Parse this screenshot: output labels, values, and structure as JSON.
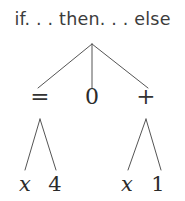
{
  "figure": {
    "kind": "syntax-tree",
    "background_color": "#ffffff",
    "line_color": "#555555",
    "text_color": "#2e2e2e",
    "header_color": "#3c3c3c",
    "header": {
      "label": "if. . . then. . . else"
    },
    "tree": {
      "root": {
        "label": "if. . . then. . . else",
        "arity": 3
      },
      "level_2": [
        {
          "label": "=",
          "role": "condition",
          "x": 40,
          "y": 97
        },
        {
          "label": "0",
          "role": "then-branch",
          "x": 92,
          "y": 97
        },
        {
          "label": "+",
          "role": "else-branch",
          "x": 146,
          "y": 97
        }
      ],
      "leaves": [
        {
          "label": "x",
          "parent": "=",
          "italic": true,
          "x": 25,
          "y": 185
        },
        {
          "label": "4",
          "parent": "=",
          "italic": false,
          "x": 55,
          "y": 185
        },
        {
          "label": "x",
          "parent": "+",
          "italic": true,
          "x": 127,
          "y": 185
        },
        {
          "label": "1",
          "parent": "+",
          "italic": false,
          "x": 158,
          "y": 185
        }
      ]
    },
    "edges": [
      {
        "from": "root",
        "to": "=",
        "x1": 92,
        "y1": 44,
        "x2": 38,
        "y2": 88
      },
      {
        "from": "root",
        "to": "0",
        "x1": 92,
        "y1": 44,
        "x2": 92,
        "y2": 88
      },
      {
        "from": "root",
        "to": "+",
        "x1": 92,
        "y1": 44,
        "x2": 148,
        "y2": 88
      },
      {
        "from": "=",
        "to": "x",
        "x1": 40,
        "y1": 119,
        "x2": 25,
        "y2": 170
      },
      {
        "from": "=",
        "to": "4",
        "x1": 40,
        "y1": 119,
        "x2": 56,
        "y2": 170
      },
      {
        "from": "+",
        "to": "x",
        "x1": 146,
        "y1": 119,
        "x2": 128,
        "y2": 170
      },
      {
        "from": "+",
        "to": "1",
        "x1": 146,
        "y1": 119,
        "x2": 161,
        "y2": 170
      }
    ]
  }
}
